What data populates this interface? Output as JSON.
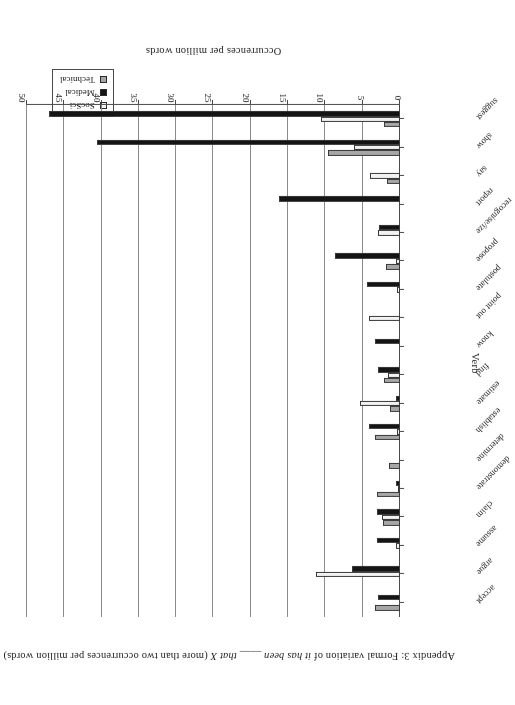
{
  "figure": {
    "title_prefix": "Appendix 3: Formal variation of ",
    "title_italic_1": "it has been",
    "title_mid": " ____ ",
    "title_italic_2": "that X",
    "title_suffix": " (more than two occurrences per million words)",
    "title_full": "Appendix 3: Formal variation of it has been ____ that X (more than two occurrences per million words)",
    "rotation_note": "180"
  },
  "legend": {
    "position": "top-right",
    "items": [
      {
        "label": "SocSci",
        "color": "#f2f2f2"
      },
      {
        "label": "Medical",
        "color": "#141414"
      },
      {
        "label": "Technical",
        "color": "#a6a6a6"
      }
    ]
  },
  "axes": {
    "value_axis_title": "Occurrences per million words",
    "category_axis_title": "Verb",
    "value_ticks": [
      "0",
      "5",
      "10",
      "15",
      "20",
      "25",
      "30",
      "35",
      "40",
      "45",
      "50"
    ],
    "value_min": 0,
    "value_max": 50,
    "value_step": 5
  },
  "chart_data": {
    "type": "bar",
    "orientation": "horizontal",
    "title": "Appendix 3: Formal variation of it has been ____ that X (more than two occurrences per million words)",
    "xlabel": "Verb",
    "ylabel": "Occurrences per million words",
    "ylim": [
      0,
      50
    ],
    "ytick_step": 5,
    "grid": true,
    "legend_position": "top-right",
    "categories": [
      "accept",
      "argue",
      "assume",
      "claim",
      "demonstrate",
      "determine",
      "establish",
      "estimate",
      "find",
      "know",
      "point out",
      "postulate",
      "propose",
      "recognise/ize",
      "report",
      "say",
      "show",
      "suggest"
    ],
    "series": [
      {
        "name": "SocSci",
        "color": "#f2f2f2",
        "values": [
          0.0,
          11.3,
          0.5,
          2.4,
          0.3,
          0.0,
          0.4,
          5.4,
          1.6,
          0.0,
          4.2,
          0.4,
          0.6,
          3.0,
          0.0,
          4.0,
          6.2,
          10.6
        ]
      },
      {
        "name": "Medical",
        "color": "#141414",
        "values": [
          2.9,
          6.5,
          3.1,
          3.1,
          0.6,
          0.0,
          4.1,
          0.6,
          3.0,
          3.4,
          0.0,
          4.4,
          8.7,
          2.8,
          16.2,
          0.0,
          40.6,
          47.1
        ]
      },
      {
        "name": "Technical",
        "color": "#a6a6a6",
        "values": [
          3.3,
          0.0,
          0.0,
          2.3,
          3.1,
          1.5,
          3.4,
          1.4,
          2.2,
          0.0,
          0.0,
          0.0,
          1.9,
          0.0,
          0.0,
          1.7,
          9.7,
          2.2
        ]
      }
    ]
  }
}
